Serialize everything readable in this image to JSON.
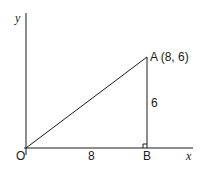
{
  "diagram": {
    "type": "right-triangle-on-axes",
    "axes": {
      "x_label": "x",
      "y_label": "y",
      "origin_label": "O"
    },
    "points": {
      "O": {
        "label": "O"
      },
      "A": {
        "label": "A (8, 6)",
        "x": 8,
        "y": 6
      },
      "B": {
        "label": "B"
      }
    },
    "sides": {
      "OB": {
        "label": "8"
      },
      "AB": {
        "label": "6"
      }
    },
    "right_angle_at": "B",
    "colors": {
      "stroke": "#1a1a1a",
      "background": "#ffffff"
    }
  }
}
